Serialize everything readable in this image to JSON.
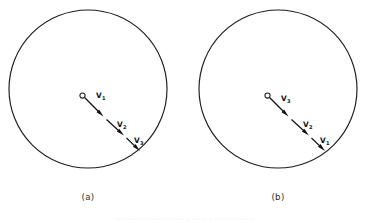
{
  "figure": {
    "background_color": "#ffffff",
    "ink_color": "#1d1d1d",
    "width": 370,
    "height": 223,
    "panels": [
      {
        "id": "panel-a",
        "caption": "(a)",
        "caption_x": 88,
        "caption_y": 200,
        "circle": {
          "cx": 88,
          "cy": 89,
          "r": 79
        },
        "origin": {
          "cx": 82.5,
          "cy": 95.5,
          "r": 2.6
        },
        "vectors": [
          {
            "name": "V1",
            "label_base": "V",
            "label_sub": "1",
            "label_x": 96,
            "label_y": 98,
            "x1": 84.8,
            "y1": 97.8,
            "x2": 103.5,
            "y2": 116.5,
            "head_angle_deg": 45
          },
          {
            "name": "V2",
            "label_base": "V",
            "label_sub": "2",
            "label_x": 117,
            "label_y": 127,
            "x1": 106.5,
            "y1": 119.5,
            "x2": 124.0,
            "y2": 135.5,
            "head_angle_deg": 45
          },
          {
            "name": "V3",
            "label_base": "V",
            "label_sub": "3",
            "label_x": 134,
            "label_y": 143,
            "x1": 126.5,
            "y1": 138.0,
            "x2": 140.0,
            "y2": 151.0,
            "head_angle_deg": 45
          }
        ]
      },
      {
        "id": "panel-b",
        "caption": "(b)",
        "caption_x": 278,
        "caption_y": 200,
        "circle": {
          "cx": 278,
          "cy": 89,
          "r": 79
        },
        "origin": {
          "cx": 267.5,
          "cy": 95.5,
          "r": 2.6
        },
        "vectors": [
          {
            "name": "V3",
            "label_base": "V",
            "label_sub": "3",
            "label_x": 281,
            "label_y": 101,
            "x1": 269.8,
            "y1": 97.8,
            "x2": 288.5,
            "y2": 116.5,
            "head_angle_deg": 45
          },
          {
            "name": "V2",
            "label_base": "V",
            "label_sub": "2",
            "label_x": 303,
            "label_y": 127,
            "x1": 291.5,
            "y1": 119.5,
            "x2": 309.0,
            "y2": 135.5,
            "head_angle_deg": 45
          },
          {
            "name": "V1",
            "label_base": "V",
            "label_sub": "1",
            "label_x": 320,
            "label_y": 143,
            "x1": 311.5,
            "y1": 138.0,
            "x2": 325.0,
            "y2": 151.0,
            "head_angle_deg": 45
          }
        ]
      }
    ],
    "footer_fragment": "··· ·· ···· ·· ··· ···· ·· ··· ····· ·· ···· ··· ·· ···· ··· ·· ····· ···"
  },
  "chart_data": {
    "type": "diagram",
    "title": "",
    "panels": [
      {
        "label": "(a)",
        "origin_marker": "open-circle",
        "vector_sequence": [
          "V1",
          "V2",
          "V3"
        ],
        "direction": "down-right",
        "segment_count": 3
      },
      {
        "label": "(b)",
        "origin_marker": "open-circle",
        "vector_sequence": [
          "V3",
          "V2",
          "V1"
        ],
        "direction": "down-right",
        "segment_count": 3
      }
    ]
  }
}
